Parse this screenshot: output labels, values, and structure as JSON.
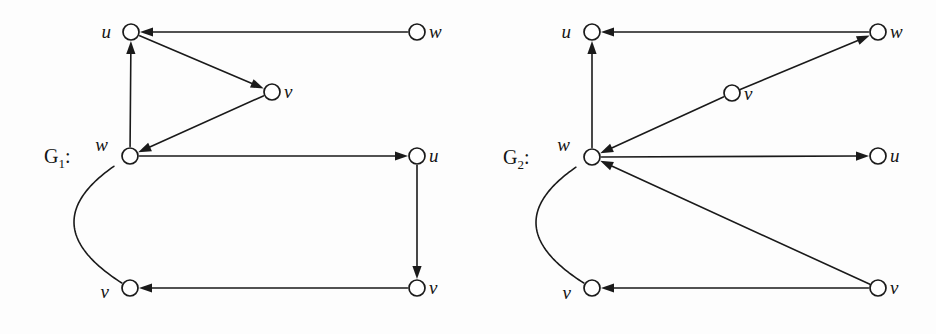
{
  "figure": {
    "background": "#fdfdfd",
    "ink": "#1a1a1a",
    "width": 936,
    "height": 334
  },
  "graphs": [
    {
      "id": "G1",
      "name_base": "G",
      "name_sub": "1",
      "name_colon": ":",
      "name_x": 44,
      "name_y": 163,
      "nodes": [
        {
          "id": "g1-u-top",
          "label": "u",
          "cx": 131,
          "cy": 32,
          "r": 8,
          "label_dx": -20,
          "label_dy": 6
        },
        {
          "id": "g1-w-topright",
          "label": "w",
          "cx": 417,
          "cy": 32,
          "r": 8,
          "label_dx": 12,
          "label_dy": 6
        },
        {
          "id": "g1-v-mid",
          "label": "v",
          "cx": 272,
          "cy": 92,
          "r": 8,
          "label_dx": 12,
          "label_dy": 6
        },
        {
          "id": "g1-w-left",
          "label": "w",
          "cx": 130,
          "cy": 156,
          "r": 8,
          "label_dx": -22,
          "label_dy": -5
        },
        {
          "id": "g1-u-right",
          "label": "u",
          "cx": 417,
          "cy": 156,
          "r": 8,
          "label_dx": 12,
          "label_dy": 6
        },
        {
          "id": "g1-v-botleft",
          "label": "v",
          "cx": 130,
          "cy": 288,
          "r": 8,
          "label_dx": -21,
          "label_dy": 10
        },
        {
          "id": "g1-v-botright",
          "label": "v",
          "cx": 417,
          "cy": 288,
          "r": 8,
          "label_dx": 12,
          "label_dy": 6
        }
      ],
      "edges": [
        {
          "from": "g1-w-topright",
          "to": "g1-u-top",
          "kind": "straight"
        },
        {
          "from": "g1-u-top",
          "to": "g1-v-mid",
          "kind": "straight"
        },
        {
          "from": "g1-v-mid",
          "to": "g1-w-left",
          "kind": "straight"
        },
        {
          "from": "g1-w-left",
          "to": "g1-u-top",
          "kind": "straight"
        },
        {
          "from": "g1-w-left",
          "to": "g1-u-right",
          "kind": "straight"
        },
        {
          "from": "g1-u-right",
          "to": "g1-v-botright",
          "kind": "straight"
        },
        {
          "from": "g1-v-botright",
          "to": "g1-v-botleft",
          "kind": "straight"
        },
        {
          "from": "g1-v-botleft",
          "to": "g1-w-left",
          "kind": "arc",
          "bulge": -56
        }
      ]
    },
    {
      "id": "G2",
      "name_base": "G",
      "name_sub": "2",
      "name_colon": ":",
      "name_x": 503,
      "name_y": 164,
      "nodes": [
        {
          "id": "g2-u-top",
          "label": "u",
          "cx": 592,
          "cy": 32,
          "r": 8,
          "label_dx": -21,
          "label_dy": 6
        },
        {
          "id": "g2-w-topright",
          "label": "w",
          "cx": 878,
          "cy": 32,
          "r": 8,
          "label_dx": 12,
          "label_dy": 6
        },
        {
          "id": "g2-v-mid",
          "label": "v",
          "cx": 732,
          "cy": 93,
          "r": 8,
          "label_dx": 12,
          "label_dy": 7
        },
        {
          "id": "g2-w-left",
          "label": "w",
          "cx": 592,
          "cy": 157,
          "r": 8,
          "label_dx": -22,
          "label_dy": -6
        },
        {
          "id": "g2-u-right",
          "label": "u",
          "cx": 878,
          "cy": 156,
          "r": 8,
          "label_dx": 12,
          "label_dy": 6
        },
        {
          "id": "g2-v-botleft",
          "label": "v",
          "cx": 592,
          "cy": 288,
          "r": 8,
          "label_dx": -21,
          "label_dy": 11
        },
        {
          "id": "g2-v-botright",
          "label": "v",
          "cx": 878,
          "cy": 288,
          "r": 8,
          "label_dx": 12,
          "label_dy": 6
        }
      ],
      "edges": [
        {
          "from": "g2-w-topright",
          "to": "g2-u-top",
          "kind": "straight"
        },
        {
          "from": "g2-w-left",
          "to": "g2-u-top",
          "kind": "straight"
        },
        {
          "from": "g2-v-mid",
          "to": "g2-w-topright",
          "kind": "straight"
        },
        {
          "from": "g2-v-mid",
          "to": "g2-w-left",
          "kind": "straight"
        },
        {
          "from": "g2-w-left",
          "to": "g2-u-right",
          "kind": "straight"
        },
        {
          "from": "g2-v-botright",
          "to": "g2-w-left",
          "kind": "straight"
        },
        {
          "from": "g2-v-botright",
          "to": "g2-v-botleft",
          "kind": "straight"
        },
        {
          "from": "g2-v-botleft",
          "to": "g2-w-left",
          "kind": "arc",
          "bulge": -56
        }
      ]
    }
  ]
}
